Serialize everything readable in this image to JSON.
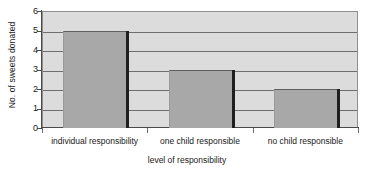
{
  "chart_data": {
    "type": "bar",
    "title": "",
    "categories": [
      "individual responsibility",
      "one child responsible",
      "no child responsible"
    ],
    "values": [
      5,
      3,
      2
    ],
    "xlabel": "level of responsibility",
    "ylabel": "No. of sweets donated",
    "ylim": [
      0,
      6
    ],
    "y_ticks": [
      0,
      1,
      2,
      3,
      4,
      5,
      6
    ],
    "y_tick_labels": [
      "0",
      "1",
      "2",
      "3",
      "4",
      "5",
      "6"
    ],
    "grid": true,
    "legend": false,
    "colors": {
      "bar_fill": "#a8a8a8",
      "bar_shadow": "#1f1f1f",
      "plot_background": "#dcdcdc",
      "gridline": "#6e6e6e",
      "axis": "#4a4a4a",
      "page_background": "#ffffff",
      "text": "#1a1a1a"
    }
  }
}
